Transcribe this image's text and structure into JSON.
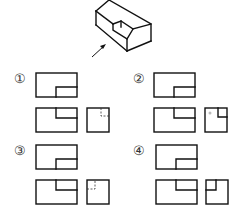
{
  "figure": {
    "type": "three-view selection problem",
    "isometric": {
      "description": "rectangular block with a stepped notch cut into a top corner",
      "view_arrow": "direction indicator pointing at front face"
    },
    "options": [
      {
        "label": "①",
        "side_view_detail": "small dashed step in upper-right corner"
      },
      {
        "label": "②",
        "side_view_detail": "solid step in upper-right corner"
      },
      {
        "label": "③",
        "side_view_detail": "small dashed step in upper-left corner"
      },
      {
        "label": "④",
        "side_view_detail": "solid step in upper-left corner"
      }
    ]
  },
  "colors": {
    "line": "#111111",
    "label": "#333333",
    "background": "#ffffff"
  }
}
